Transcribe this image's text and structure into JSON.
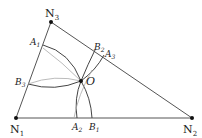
{
  "diagram": {
    "type": "geometry-triangle-construction",
    "colors": {
      "edge": "#555555",
      "arc": "#444444",
      "light_arc": "#aaaaaa",
      "point": "#111111",
      "text": "#222222"
    },
    "vertices": {
      "N1": {
        "label": "N",
        "sub": "1"
      },
      "N2": {
        "label": "N",
        "sub": "2"
      },
      "N3": {
        "label": "N",
        "sub": "3"
      }
    },
    "center": {
      "label": "O"
    },
    "edge_points": {
      "A1": {
        "label": "A",
        "sub": "1"
      },
      "A2": {
        "label": "A",
        "sub": "2"
      },
      "A3": {
        "label": "A",
        "sub": "3"
      },
      "B1": {
        "label": "B",
        "sub": "1"
      },
      "B2": {
        "label": "B",
        "sub": "2"
      },
      "B3": {
        "label": "B",
        "sub": "3"
      }
    }
  }
}
